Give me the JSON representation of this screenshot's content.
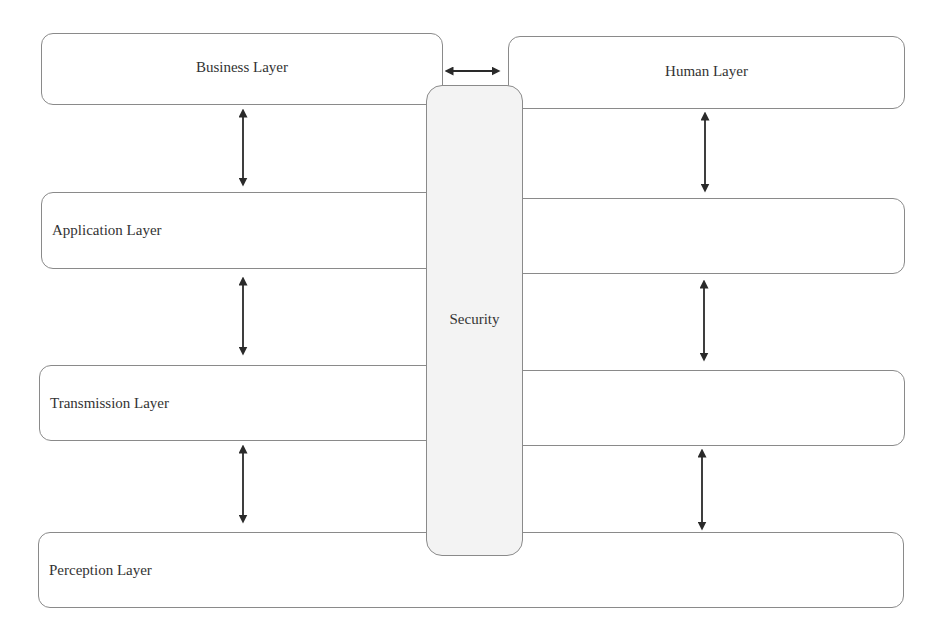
{
  "diagram": {
    "type": "layered-architecture",
    "layers": [
      {
        "id": "business",
        "label": "Business Layer"
      },
      {
        "id": "human",
        "label": "Human Layer"
      },
      {
        "id": "application",
        "label": "Application Layer"
      },
      {
        "id": "transmission",
        "label": "Transmission Layer"
      },
      {
        "id": "perception",
        "label": "Perception Layer"
      }
    ],
    "security": {
      "label": "Security"
    },
    "connections": [
      {
        "from": "business",
        "to": "human",
        "type": "bidirectional"
      },
      {
        "from": "business",
        "to": "application",
        "type": "bidirectional"
      },
      {
        "from": "application",
        "to": "transmission",
        "type": "bidirectional"
      },
      {
        "from": "transmission",
        "to": "perception",
        "type": "bidirectional"
      },
      {
        "from": "human",
        "to": "application",
        "type": "bidirectional"
      },
      {
        "from": "application",
        "to": "transmission",
        "type": "bidirectional",
        "side": "right"
      },
      {
        "from": "transmission",
        "to": "perception",
        "type": "bidirectional",
        "side": "right"
      }
    ],
    "colors": {
      "border": "#8a8a8a",
      "security_fill": "#f3f3f3",
      "arrow": "#2a2a2a",
      "text": "#333333"
    }
  }
}
